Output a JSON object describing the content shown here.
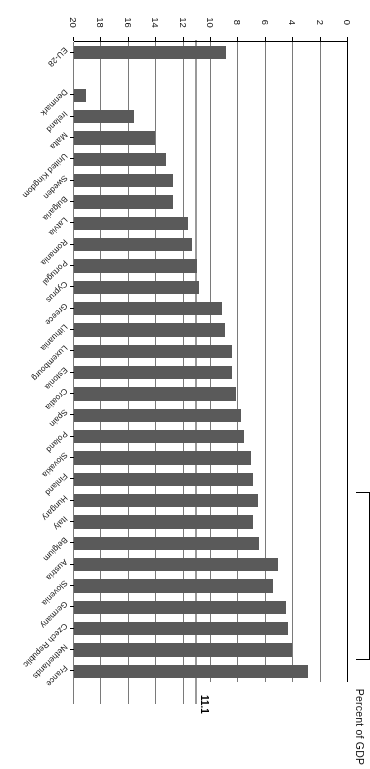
{
  "chart_data": {
    "type": "bar",
    "orientation": "horizontal",
    "title": "",
    "xlabel": "Percent of GDP",
    "ylabel": "",
    "xlim": [
      0,
      20
    ],
    "xticks": [
      0,
      2,
      4,
      6,
      8,
      10,
      12,
      14,
      16,
      18,
      20
    ],
    "xtick_labels": [
      "0",
      "2",
      "4",
      "6",
      "8",
      "10",
      "12",
      "14",
      "16",
      "18",
      "20"
    ],
    "grid": true,
    "legend": null,
    "bar_color": "#5a5a5a",
    "reference_line": {
      "value": 11.1,
      "label": "11.1",
      "color": "#9a9a9a",
      "series": "EU-28 average"
    },
    "categories": [
      "France",
      "Netherlands",
      "Czech Republic",
      "Germany",
      "Slovenia",
      "Austria",
      "Belgium",
      "Italy",
      "Hungary",
      "Finland",
      "Slovakia",
      "Poland",
      "Spain",
      "Croatia",
      "Estonia",
      "Luxembourg",
      "Lithuania",
      "Greece",
      "Cyprus",
      "Portugal",
      "Romania",
      "Latvia",
      "Bulgaria",
      "Sweden",
      "United Kingdom",
      "Malta",
      "Ireland",
      "Denmark",
      "EU-28"
    ],
    "values": [
      17.1,
      15.9,
      15.6,
      15.5,
      14.5,
      14.9,
      13.5,
      13.1,
      13.4,
      13.1,
      12.9,
      12.4,
      12.2,
      11.8,
      11.5,
      11.5,
      11.0,
      10.8,
      9.1,
      9.0,
      8.6,
      8.3,
      7.2,
      7.2,
      6.7,
      5.9,
      4.4,
      0.9,
      11.1
    ],
    "gap_before": [
      "EU-28"
    ]
  },
  "axis": {
    "title": "Percent of GDP"
  }
}
